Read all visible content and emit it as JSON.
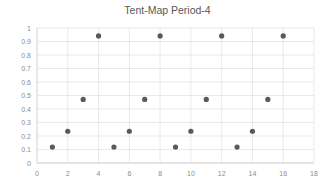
{
  "chart_data": {
    "type": "scatter",
    "title": "Tent-Map Period-4",
    "xlabel": "",
    "ylabel": "",
    "xlim": [
      0,
      18
    ],
    "ylim": [
      0,
      1
    ],
    "x_ticks": [
      0,
      2,
      4,
      6,
      8,
      10,
      12,
      14,
      16,
      18
    ],
    "x_tick_labels": [
      "0",
      "2",
      "4",
      "6",
      "8",
      "10",
      "12",
      "14",
      "16",
      "18"
    ],
    "y_ticks": [
      0,
      0.1,
      0.2,
      0.3,
      0.4,
      0.5,
      0.6,
      0.7,
      0.8,
      0.9,
      1
    ],
    "y_tick_labels": [
      "0",
      "0.1",
      "0.2",
      "0.3",
      "0.4",
      "0.5",
      "0.6",
      "0.7",
      "0.8",
      "0.9",
      "1"
    ],
    "grid": true,
    "legend": null,
    "marker_color": "#595959",
    "series": [
      {
        "name": "Series1",
        "x": [
          1,
          2,
          3,
          4,
          5,
          6,
          7,
          8,
          9,
          10,
          11,
          12,
          13,
          14,
          15,
          16
        ],
        "y": [
          0.118,
          0.235,
          0.471,
          0.941,
          0.118,
          0.235,
          0.471,
          0.941,
          0.118,
          0.235,
          0.471,
          0.941,
          0.118,
          0.235,
          0.471,
          0.941
        ]
      }
    ]
  }
}
